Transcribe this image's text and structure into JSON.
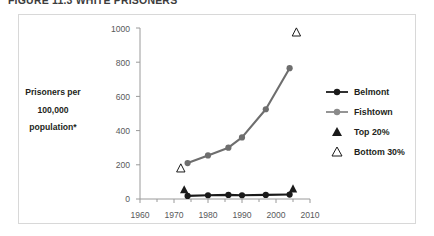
{
  "caption": {
    "text": "FIGURE 11.3   WHITE PRISONERS"
  },
  "chart_data": {
    "type": "line",
    "title": "",
    "xlabel": "",
    "ylabel": "Prisoners per 100,000 population*",
    "ylabel_lines": [
      "Prisoners per",
      "100,000",
      "population*"
    ],
    "xlim": [
      1960,
      2010
    ],
    "ylim": [
      0,
      1000
    ],
    "xticks": [
      1960,
      1970,
      1980,
      1990,
      2000,
      2010
    ],
    "yticks": [
      0,
      200,
      400,
      600,
      800,
      1000
    ],
    "grid": false,
    "legend_position": "right",
    "series": [
      {
        "name": "Belmont",
        "color": "#1a1a1a",
        "marker": "circle",
        "x": [
          1974,
          1980,
          1986,
          1990,
          1997,
          2004
        ],
        "values": [
          18,
          22,
          24,
          22,
          24,
          26
        ]
      },
      {
        "name": "Fishtown",
        "color": "#6e6e6e",
        "marker": "circle",
        "x": [
          1974,
          1980,
          1986,
          1990,
          1997,
          2004
        ],
        "values": [
          210,
          255,
          300,
          360,
          525,
          765
        ]
      }
    ],
    "endpoint_markers": [
      {
        "name": "Top 20%",
        "marker": "filled-triangle",
        "color": "#1a1a1a",
        "points": [
          {
            "x": 1973,
            "y": 55
          },
          {
            "x": 2005,
            "y": 60
          }
        ]
      },
      {
        "name": "Bottom 30%",
        "marker": "open-triangle",
        "color": "#1a1a1a",
        "points": [
          {
            "x": 1972,
            "y": 180
          },
          {
            "x": 2006,
            "y": 975
          }
        ]
      }
    ],
    "legend": [
      {
        "label": "Belmont",
        "marker": "line-circle",
        "color": "#1a1a1a"
      },
      {
        "label": "Fishtown",
        "marker": "line-circle",
        "color": "#8a8a8a"
      },
      {
        "label": "Top 20%",
        "marker": "filled-triangle",
        "color": "#1a1a1a"
      },
      {
        "label": "Bottom 30%",
        "marker": "open-triangle",
        "color": "#1a1a1a"
      }
    ]
  },
  "axis": {
    "y_tick_labels": [
      "1000",
      "800",
      "600",
      "400",
      "200",
      "0"
    ],
    "x_tick_labels": [
      "1960",
      "1970",
      "1980",
      "1990",
      "2000",
      "2010"
    ]
  },
  "colors": {
    "belmont": "#1a1a1a",
    "fishtown": "#8a8a8a",
    "axis": "#9a9a9a",
    "frame": "#d8d8d8",
    "text": "#231f20",
    "tick_text": "#58595b"
  }
}
